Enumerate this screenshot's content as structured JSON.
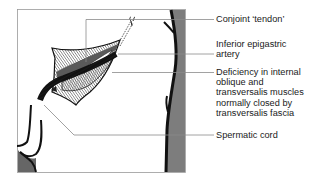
{
  "figure": {
    "labels": [
      {
        "id": "conjoint-tendon",
        "lines": [
          "Conjoint ‘tendon’"
        ]
      },
      {
        "id": "inferior-epigastric-artery",
        "lines": [
          "Inferior epigastric",
          "artery"
        ]
      },
      {
        "id": "deficiency",
        "lines": [
          "Deficiency in internal",
          "oblique and",
          "transversalis muscles",
          "normally closed by",
          "transversalis fascia"
        ]
      },
      {
        "id": "spermatic-cord",
        "lines": [
          "Spermatic cord"
        ]
      }
    ]
  },
  "colors": {
    "ink": "#111111",
    "leader": "#8a8a8a",
    "shade": "#7a7a7a",
    "muscle_dark": "#555555",
    "frame": "#9a9a9a"
  }
}
